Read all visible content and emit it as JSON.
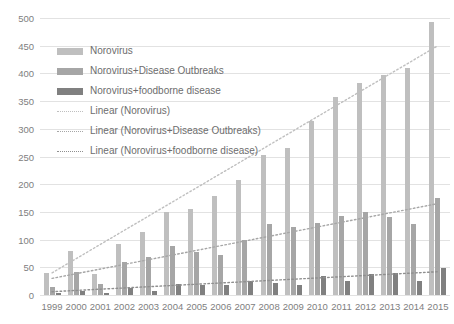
{
  "chart_data": {
    "type": "bar",
    "title": "",
    "xlabel": "",
    "ylabel": "",
    "ylim": [
      0,
      500
    ],
    "ytick_step": 50,
    "grid": true,
    "legend_position": "inside-top-left",
    "categories": [
      "1999",
      "2000",
      "2001",
      "2002",
      "2003",
      "2004",
      "2005",
      "2006",
      "2007",
      "2008",
      "2009",
      "2010",
      "2011",
      "2012",
      "2013",
      "2014",
      "2015"
    ],
    "yticks": [
      "0",
      "50",
      "100",
      "150",
      "200",
      "250",
      "300",
      "350",
      "400",
      "450",
      "500"
    ],
    "series": [
      {
        "name": "Norovirus",
        "color": "#bfbfbf",
        "values": [
          40,
          80,
          38,
          92,
          113,
          150,
          155,
          178,
          207,
          252,
          265,
          315,
          357,
          383,
          398,
          410,
          493
        ]
      },
      {
        "name": "Norovirus+Disease Outbreaks",
        "color": "#a6a6a6",
        "values": [
          14,
          42,
          20,
          60,
          68,
          88,
          78,
          72,
          100,
          128,
          122,
          130,
          143,
          150,
          140,
          128,
          175
        ]
      },
      {
        "name": "Norovirus+foodborne disease",
        "color": "#808080",
        "values": [
          4,
          8,
          4,
          12,
          8,
          20,
          18,
          18,
          26,
          22,
          18,
          35,
          25,
          38,
          40,
          25,
          48
        ]
      }
    ],
    "trendlines": [
      {
        "name": "Linear (Norovirus)",
        "color": "#bfbfbf",
        "style": "dotted",
        "start": 40,
        "end": 450
      },
      {
        "name": "Linear (Norovirus+Disease Outbreaks)",
        "color": "#a6a6a6",
        "style": "dotted",
        "start": 30,
        "end": 165
      },
      {
        "name": "Linear (Norovirus+foodborne disease)",
        "color": "#8f8f8f",
        "style": "dotted",
        "start": 6,
        "end": 42
      }
    ],
    "legend": [
      {
        "label": "Norovirus",
        "type": "swatch",
        "series": 0
      },
      {
        "label": "Norovirus+Disease Outbreaks",
        "type": "swatch",
        "series": 1
      },
      {
        "label": "Norovirus+foodborne disease",
        "type": "swatch",
        "series": 2
      },
      {
        "label": "Linear (Norovirus)",
        "type": "line",
        "series": 0
      },
      {
        "label": "Linear (Norovirus+Disease Outbreaks)",
        "type": "line",
        "series": 1
      },
      {
        "label": "Linear (Norovirus+foodborne disease)",
        "type": "line",
        "series": 2
      }
    ]
  }
}
